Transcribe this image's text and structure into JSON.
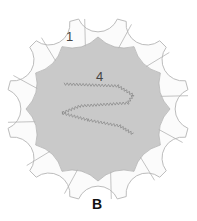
{
  "diagram": {
    "center": [
      98,
      109
    ],
    "scallop_count": 12,
    "cusp_radius": 72,
    "gray_edge_mid_radius": 63,
    "petal_outer_radius": 92,
    "scallop_center_radius": 95,
    "scallop_radius": 21,
    "colors": {
      "center_fill": "#c9c9c9",
      "petal_fill": "#fbfbfb",
      "outline": "#b4b4b4",
      "zigzag": "#8c8c8c"
    }
  },
  "labels": {
    "petal": "1",
    "center": "4",
    "caption": "B"
  }
}
